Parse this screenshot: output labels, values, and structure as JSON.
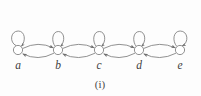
{
  "figure": {
    "caption": "(i)",
    "type": "directed-graph-diagram",
    "background_color": "#fdfdfd",
    "line_color": "#7d7d7d",
    "label_color": "#3d3d3d",
    "node_fill": "#ffffff"
  },
  "graph": {
    "nodes": [
      {
        "id": "a",
        "label": "a",
        "cx": 18,
        "cy": 50,
        "r": 4.6,
        "label_x": 18,
        "label_y": 69,
        "self_loop": "top-left"
      },
      {
        "id": "b",
        "label": "b",
        "cx": 58,
        "cy": 50,
        "r": 4.6,
        "label_x": 58,
        "label_y": 69,
        "self_loop": "top"
      },
      {
        "id": "c",
        "label": "c",
        "cx": 99,
        "cy": 50,
        "r": 4.6,
        "label_x": 99,
        "label_y": 69,
        "self_loop": "top"
      },
      {
        "id": "d",
        "label": "d",
        "cx": 139,
        "cy": 50,
        "r": 4.6,
        "label_x": 139,
        "label_y": 69,
        "self_loop": "top"
      },
      {
        "id": "e",
        "label": "e",
        "cx": 180,
        "cy": 50,
        "r": 4.6,
        "label_x": 180,
        "label_y": 69,
        "self_loop": "top-right"
      }
    ],
    "self_loops": [
      {
        "node": "a",
        "arrow": true
      },
      {
        "node": "b",
        "arrow": true
      },
      {
        "node": "c",
        "arrow": true
      },
      {
        "node": "d",
        "arrow": true
      },
      {
        "node": "e",
        "arrow": true
      }
    ],
    "edges": [
      {
        "from": "a",
        "to": "b",
        "direction": "rightward",
        "curve": "above"
      },
      {
        "from": "b",
        "to": "a",
        "direction": "leftward",
        "curve": "below"
      },
      {
        "from": "b",
        "to": "c",
        "direction": "rightward",
        "curve": "above"
      },
      {
        "from": "c",
        "to": "b",
        "direction": "leftward",
        "curve": "below"
      },
      {
        "from": "c",
        "to": "d",
        "direction": "rightward",
        "curve": "above"
      },
      {
        "from": "d",
        "to": "c",
        "direction": "leftward",
        "curve": "below"
      },
      {
        "from": "d",
        "to": "e",
        "direction": "rightward",
        "curve": "above"
      },
      {
        "from": "e",
        "to": "d",
        "direction": "leftward",
        "curve": "below"
      }
    ],
    "node_count": 5,
    "edge_count": 8,
    "self_loop_count": 5
  }
}
